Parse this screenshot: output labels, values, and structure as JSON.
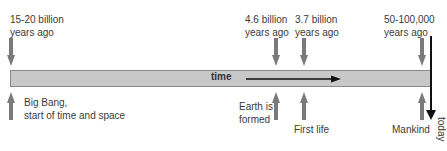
{
  "timeline": {
    "bar_label": "time",
    "end_label": "today",
    "events": [
      {
        "time": "15-20 billion\nyears ago",
        "time_line1": "15-20 billion",
        "time_line2": "years ago",
        "event_line1": "Big Bang,",
        "event_line2": "start of time and space"
      },
      {
        "time_line1": "4.6 billion",
        "time_line2": "years ago",
        "event_line1": "Earth is",
        "event_line2": "formed"
      },
      {
        "time_line1": "3.7 billion",
        "time_line2": "years ago",
        "event_line1": "First life",
        "event_line2": ""
      },
      {
        "time_line1": "50-100,000",
        "time_line2": "years ago",
        "event_line1": "Mankind",
        "event_line2": ""
      }
    ]
  },
  "colors": {
    "bar": "#c8c8c8",
    "arrow": "#7a7a7a",
    "text": "#3a3a3a",
    "today_line": "#111111"
  }
}
